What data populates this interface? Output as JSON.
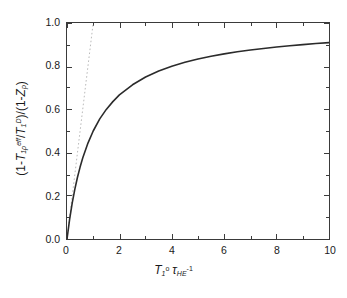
{
  "chart_data": {
    "type": "line",
    "title": "",
    "xlabel_plain": "T1^o tau_HE^-1",
    "ylabel_plain": "(1-T1rho^eff/T1^D)/(1-Zp)",
    "xlim": [
      0,
      10
    ],
    "ylim": [
      0,
      1.0
    ],
    "grid": false,
    "legend": "none",
    "background_color": "#ffffff",
    "frame_color": "#3a3a3a",
    "x_ticks_major": [
      "0",
      "2",
      "4",
      "6",
      "8",
      "10"
    ],
    "x_ticks_major_values": [
      0,
      2,
      4,
      6,
      8,
      10
    ],
    "x_ticks_minor_values": [
      1,
      3,
      5,
      7,
      9
    ],
    "y_ticks_major": [
      "0.0",
      "0.2",
      "0.4",
      "0.6",
      "0.8",
      "1.0"
    ],
    "y_ticks_major_values": [
      0.0,
      0.2,
      0.4,
      0.6,
      0.8,
      1.0
    ],
    "y_ticks_minor_values": [
      0.1,
      0.3,
      0.5,
      0.7,
      0.9
    ],
    "series": [
      {
        "name": "saturation-curve",
        "style": "solid",
        "color": "#2b2b2b",
        "width": 1.6,
        "formula": "y = x / (1 + x)",
        "x": [
          0,
          0.1,
          0.2,
          0.3,
          0.4,
          0.5,
          0.6,
          0.8,
          1.0,
          1.25,
          1.5,
          1.75,
          2.0,
          2.5,
          3.0,
          3.5,
          4.0,
          4.5,
          5.0,
          5.5,
          6.0,
          6.5,
          7.0,
          7.5,
          8.0,
          8.5,
          9.0,
          9.5,
          10.0
        ],
        "values": [
          0.0,
          0.091,
          0.167,
          0.231,
          0.286,
          0.333,
          0.375,
          0.444,
          0.5,
          0.556,
          0.6,
          0.636,
          0.667,
          0.714,
          0.75,
          0.778,
          0.8,
          0.818,
          0.833,
          0.846,
          0.857,
          0.867,
          0.875,
          0.882,
          0.889,
          0.895,
          0.9,
          0.905,
          0.909
        ]
      },
      {
        "name": "initial-slope-tangent",
        "style": "dotted",
        "color": "#b9b9b9",
        "width": 1.0,
        "formula": "y = x",
        "x": [
          0,
          1.0
        ],
        "values": [
          0.0,
          1.0
        ]
      }
    ]
  },
  "axes": {
    "x_title": {
      "var_t": "T",
      "t_sub": "1",
      "t_sup": "o",
      "var_tau": "τ",
      "tau_sub": "HE",
      "tau_sup": "-1"
    },
    "y_title": {
      "open": "(1-",
      "t1_var": "T",
      "t1_sub": "1ρ",
      "t1_sup": "eff",
      "slash": "/",
      "t2_var": "T",
      "t2_sub": "1",
      "t2_sup": "D",
      "mid": ")/(1-",
      "z_var": "Z",
      "z_sub": "p",
      "close": ")"
    }
  }
}
